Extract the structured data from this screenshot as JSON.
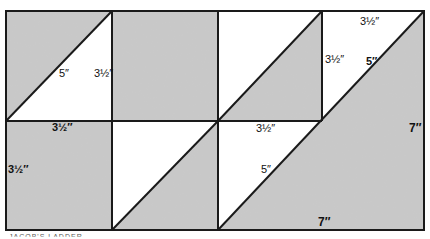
{
  "diagram": {
    "colors": {
      "gray": "#c9c9c9",
      "white": "#ffffff",
      "line": "#1a1a1a"
    },
    "grid": {
      "columns": 4,
      "rows": 2
    },
    "labels": {
      "tl_hyp": "5″",
      "tl_side": "3½″",
      "tr_top": "3½″",
      "tr_side": "3½″",
      "tr_hyp": "5″",
      "bl_top": "3½″",
      "bl_side": "3½″",
      "bc_top": "3½″",
      "bc_hyp": "5″",
      "big_right": "7″",
      "big_bottom": "7″"
    },
    "caption": "JACOB'S LADDER"
  }
}
